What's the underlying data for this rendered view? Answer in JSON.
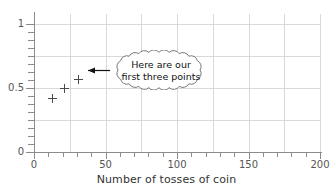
{
  "chart_data": {
    "type": "scatter",
    "title": "",
    "xlabel": "Number of tosses of coin",
    "ylabel": "",
    "xlim": [
      0,
      200
    ],
    "ylim": [
      0,
      1.08
    ],
    "grid": true,
    "legend": null,
    "x_ticks_major": [
      0,
      50,
      100,
      150,
      200
    ],
    "x_ticks_major_labels": [
      "0",
      "50",
      "100",
      "150",
      "200"
    ],
    "x_tick_minor_step": 10,
    "x_gridlines": [
      25,
      50,
      75,
      100,
      125,
      150,
      175,
      200
    ],
    "y_ticks_major": [
      0,
      0.5,
      1
    ],
    "y_ticks_major_labels": [
      "0",
      "0.5",
      "1"
    ],
    "y_tick_minor_step": 0.0625,
    "y_gridlines": [
      0.25,
      0.5,
      0.75,
      1.0
    ],
    "marker": "plus",
    "marker_color": "#4a4a4a",
    "grid_color": "#d9d9d9",
    "axis_color": "#8c8c8c",
    "points": [
      {
        "x": 13,
        "y": 0.42
      },
      {
        "x": 21,
        "y": 0.5
      },
      {
        "x": 31,
        "y": 0.565
      }
    ],
    "annotations": [
      {
        "name": "callout-bubble",
        "shape": "cloud",
        "lines": [
          "Here are our",
          "first three points"
        ],
        "arrow": "left",
        "points_to": {
          "x": 31,
          "y": 0.565
        }
      }
    ]
  }
}
